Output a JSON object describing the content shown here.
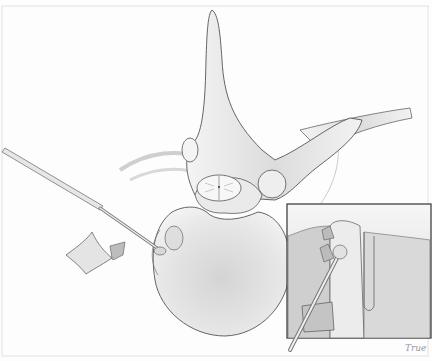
{
  "illustration": {
    "subject": "Axial view of vertebra with spinal cord and probe instrument, with magnified inset",
    "colors": {
      "background": "#fdfdfd",
      "bone_fill": "#e9e9e9",
      "bone_shade": "#c9c9c9",
      "outline": "#555555",
      "inset_border": "#333333",
      "flap_fill": "#bdbdbd"
    },
    "inset": {
      "x": 287,
      "y": 204,
      "width": 144,
      "height": 134
    },
    "signature": "True"
  }
}
